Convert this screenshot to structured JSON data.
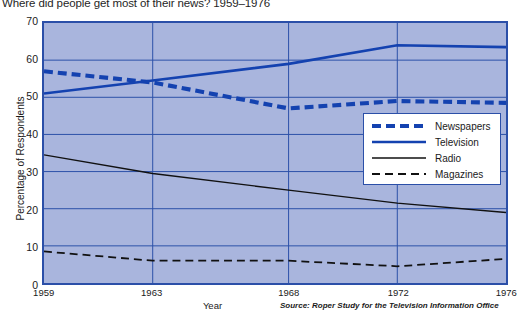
{
  "chart_data": {
    "type": "line",
    "title": "Where did people get most of their news? 1959–1976",
    "xlabel": "Year",
    "ylabel": "Percentage of Respondents",
    "source": "Source: Roper Study for the Television Information Office",
    "x": [
      1959,
      1963,
      1968,
      1972,
      1976
    ],
    "xticklabels": [
      "1959",
      "1963",
      "1968",
      "1972",
      "1976"
    ],
    "yticklabels": [
      "0",
      "10",
      "20",
      "30",
      "40",
      "50",
      "60",
      "70"
    ],
    "yticks": [
      0,
      10,
      20,
      30,
      40,
      50,
      60,
      70
    ],
    "xlim": [
      1959,
      1976
    ],
    "ylim": [
      0,
      70
    ],
    "grid": true,
    "legend_position": "center-right",
    "plot_background": "#a9b5dd",
    "grid_color": "#2b4fa8",
    "frame_color": "#2b4fa8",
    "series": [
      {
        "name": "Newspapers",
        "values": [
          57,
          54,
          47,
          49,
          48.5
        ],
        "color": "#1442b0",
        "style": "thick-dashed",
        "width": 4.2,
        "dash": "9 5"
      },
      {
        "name": "Television",
        "values": [
          51,
          54.5,
          59,
          64,
          63.5
        ],
        "color": "#1442b0",
        "style": "solid",
        "width": 2.6,
        "dash": "none"
      },
      {
        "name": "Radio",
        "values": [
          34.5,
          29.5,
          25,
          21.5,
          19
        ],
        "color": "#111111",
        "style": "solid",
        "width": 1.5,
        "dash": "none"
      },
      {
        "name": "Magazines",
        "values": [
          8.5,
          6,
          6,
          4.5,
          6.5
        ],
        "color": "#111111",
        "style": "dashed",
        "width": 1.8,
        "dash": "8 5"
      }
    ]
  }
}
